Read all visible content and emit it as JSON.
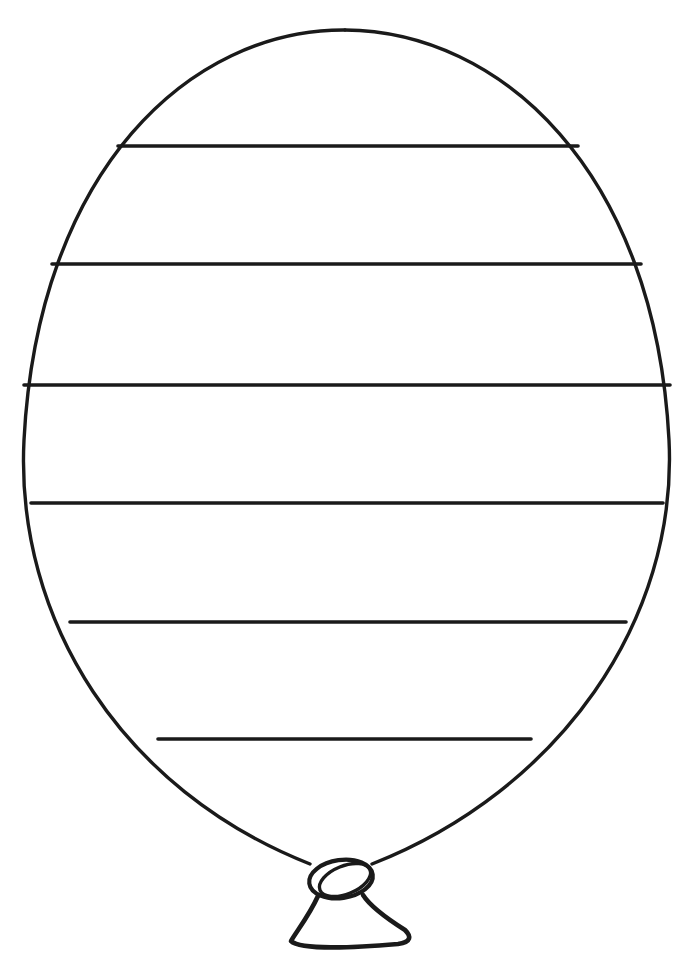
{
  "page": {
    "background_color": "#ffffff",
    "line_color": "#1a1a1a",
    "width": 698,
    "height": 966
  },
  "drawing": {
    "type": "line-art",
    "figure_name": "balloon",
    "fill": "none",
    "stripe_count": 6,
    "parts": [
      {
        "name": "balloon-body",
        "label": "balloon body outline"
      },
      {
        "name": "balloon-stripes",
        "label": "horizontal stripe lines"
      },
      {
        "name": "balloon-neck",
        "label": "neck lines to knot"
      },
      {
        "name": "balloon-knot",
        "label": "tied knot"
      },
      {
        "name": "balloon-tail",
        "label": "balloon tail skirt"
      }
    ],
    "body_path": "M 345 30 C 500 31 655 170 669 440 C 678 620 560 790 372 864 L 310 864 C 122 790 15 620 24 440 C 38 170 190 29 345 30 Z",
    "body_left_path": "M 345 30 C 190 29 38 170 24 440 C 15 620 122 790 310 864",
    "body_right_path": "M 345 30 C 500 31 655 170 669 440 C 678 620 560 790 372 864",
    "stripes": [
      {
        "id": "stripe-1",
        "y": 146,
        "x1": 118,
        "x2": 578
      },
      {
        "id": "stripe-2",
        "y": 264,
        "x1": 52,
        "x2": 641
      },
      {
        "id": "stripe-3",
        "y": 385,
        "x1": 24,
        "x2": 670
      },
      {
        "id": "stripe-4",
        "y": 503,
        "x1": 31,
        "x2": 663
      },
      {
        "id": "stripe-5",
        "y": 622,
        "x1": 70,
        "x2": 626
      },
      {
        "id": "stripe-6",
        "y": 739,
        "x1": 158,
        "x2": 531
      }
    ],
    "knot": {
      "outer": {
        "cx": 341,
        "cy": 879,
        "rx": 32,
        "ry": 19,
        "rotation": -8
      },
      "inner": {
        "cx": 345,
        "cy": 880,
        "rx": 27,
        "ry": 14,
        "rotation": -22
      }
    },
    "tail_path": "M 318 896 C 309 916 296 932 291 941 C 300 950 352 948 398 944 C 412 942 411 936 405 930 C 386 918 370 906 363 895"
  }
}
